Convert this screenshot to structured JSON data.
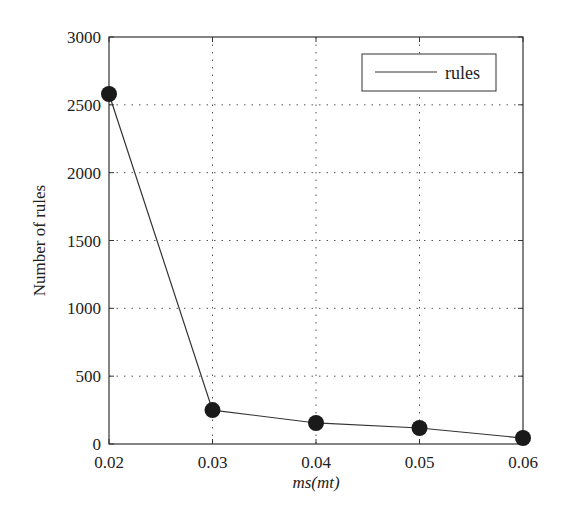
{
  "chart_data": {
    "type": "line",
    "title": "",
    "xlabel": "ms(mt)",
    "ylabel": "Number of rules",
    "x": [
      0.02,
      0.03,
      0.04,
      0.05,
      0.06
    ],
    "series": [
      {
        "name": "rules",
        "values": [
          2580,
          250,
          155,
          118,
          44
        ],
        "color": "#333333",
        "marker": "circle"
      }
    ],
    "xlim": [
      0.02,
      0.06
    ],
    "ylim": [
      0,
      3000
    ],
    "xticks": [
      "0.02",
      "0.03",
      "0.04",
      "0.05",
      "0.06"
    ],
    "xtick_values": [
      0.02,
      0.03,
      0.04,
      0.05,
      0.06
    ],
    "yticks": [
      "0",
      "500",
      "1000",
      "1500",
      "2000",
      "2500",
      "3000"
    ],
    "ytick_values": [
      0,
      500,
      1000,
      1500,
      2000,
      2500,
      3000
    ],
    "grid": true,
    "legend": {
      "position": "top-right",
      "entries": [
        "rules"
      ]
    }
  }
}
